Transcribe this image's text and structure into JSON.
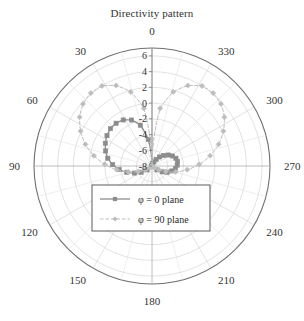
{
  "chart_data": {
    "type": "line",
    "subtype": "polar",
    "title": "Directivity pattern",
    "xlabel": "",
    "ylabel": "",
    "grid": true,
    "legend_position": "center",
    "angle_unit": "degrees",
    "angle_direction": "counterclockwise",
    "angle_zero_location": "N",
    "angle_ticks": [
      0,
      30,
      60,
      90,
      120,
      150,
      180,
      210,
      240,
      270,
      300,
      330
    ],
    "angle_tick_labels": [
      "0",
      "30",
      "60",
      "90",
      "120",
      "150",
      "180",
      "210",
      "240",
      "270",
      "300",
      "330"
    ],
    "radial_ticks": [
      6,
      4,
      2,
      0,
      -2,
      -4,
      -6,
      -8
    ],
    "radial_tick_labels": [
      "6",
      "4",
      "2",
      "0",
      "-2",
      "-4",
      "-6",
      "-8"
    ],
    "rlim": [
      -8,
      7
    ],
    "rlabel_angle": 0,
    "colors": {
      "series_phi0": "#8c8c8c",
      "series_phi90": "#bdbdbd",
      "axis": "#707070",
      "grid": "#cfcfcf",
      "text": "#333333"
    },
    "series": [
      {
        "name": "phi0",
        "label": "φ = 0 plane",
        "color": "#8c8c8c",
        "marker": "square",
        "linestyle": "solid",
        "theta": [
          0,
          8,
          16,
          24,
          32,
          40,
          48,
          56,
          64,
          72,
          80,
          88,
          96,
          104,
          112,
          120,
          128,
          136,
          180,
          224,
          232,
          240,
          248,
          256,
          264,
          272,
          280,
          288,
          296,
          304,
          312,
          320,
          328,
          336,
          344,
          352,
          360
        ],
        "r": [
          -8.0,
          -4.6,
          -2.6,
          -1.6,
          -1.1,
          -0.9,
          -0.9,
          -1.1,
          -1.4,
          -1.8,
          -2.3,
          -3.0,
          -3.8,
          -4.7,
          -5.6,
          -6.4,
          -7.2,
          -7.9,
          -8.0,
          -7.9,
          -7.2,
          -6.5,
          -5.9,
          -5.4,
          -5.0,
          -4.8,
          -4.7,
          -4.8,
          -5.1,
          -5.5,
          -6.0,
          -6.5,
          -7.0,
          -7.4,
          -7.7,
          -7.9,
          -8.0
        ]
      },
      {
        "name": "phi90",
        "label": "φ = 90 plane",
        "color": "#bdbdbd",
        "marker": "diamond",
        "linestyle": "dashed",
        "theta": [
          0,
          8,
          16,
          24,
          32,
          40,
          48,
          56,
          64,
          72,
          80,
          88,
          96,
          104,
          112,
          120,
          128,
          136,
          180,
          224,
          232,
          240,
          248,
          256,
          264,
          272,
          280,
          288,
          296,
          304,
          312,
          320,
          328,
          336,
          344,
          352,
          360
        ],
        "r": [
          -8.0,
          -0.6,
          1.8,
          3.2,
          4.0,
          4.1,
          3.8,
          3.1,
          2.1,
          0.9,
          -0.5,
          -2.0,
          -3.5,
          -4.9,
          -6.1,
          -7.0,
          -7.6,
          -7.9,
          -8.0,
          -7.9,
          -7.6,
          -7.0,
          -6.1,
          -4.9,
          -3.5,
          -2.0,
          -0.5,
          0.9,
          2.1,
          3.1,
          3.8,
          4.1,
          4.0,
          3.2,
          1.8,
          -0.6,
          -8.0
        ]
      }
    ],
    "legend_entries": [
      {
        "label": "φ = 0 plane",
        "color": "#8c8c8c",
        "marker": "square",
        "linestyle": "solid"
      },
      {
        "label": "φ = 90 plane",
        "color": "#bdbdbd",
        "marker": "diamond",
        "linestyle": "dashed"
      }
    ]
  }
}
